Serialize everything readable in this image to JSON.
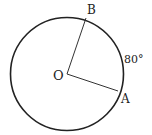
{
  "diagram": {
    "type": "circle-geometry",
    "center_label": "O",
    "points": [
      {
        "label": "B"
      },
      {
        "label": "A"
      }
    ],
    "arc_label": "80°",
    "colors": {
      "stroke": "#222222",
      "background": "#ffffff"
    }
  }
}
